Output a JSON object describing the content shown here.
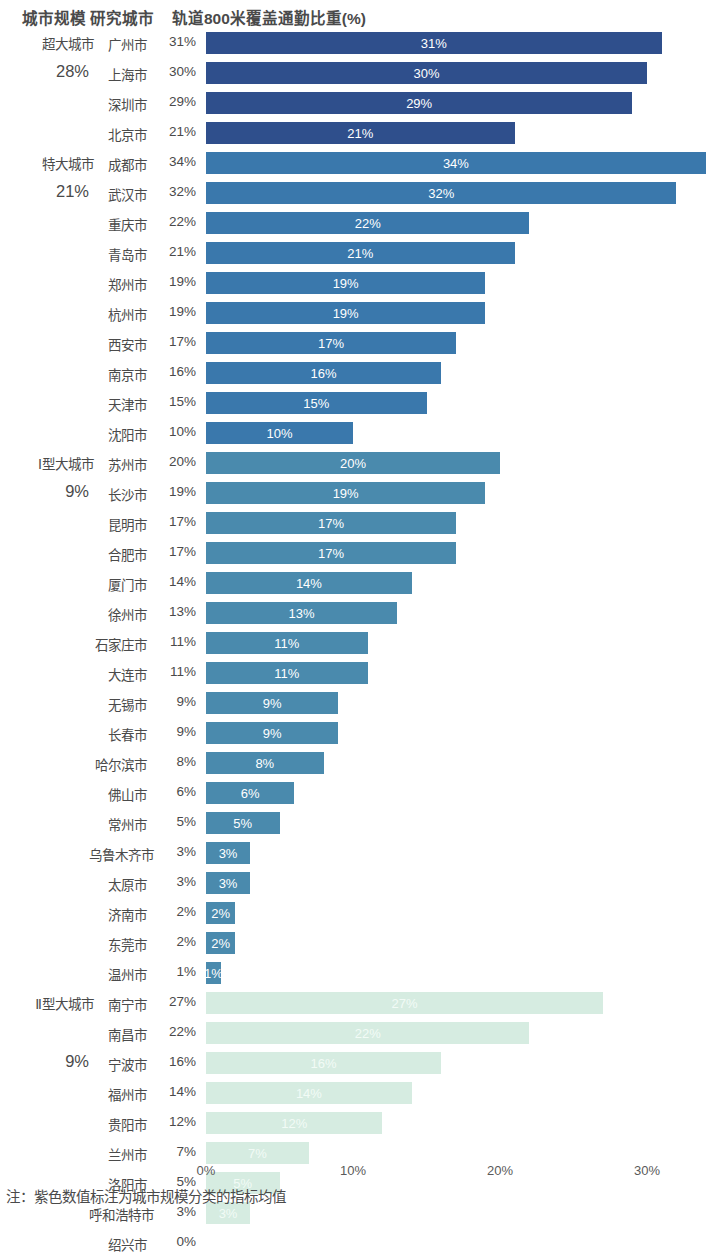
{
  "header": {
    "col_size": "城市规模",
    "col_city": "研究城市",
    "col_value": "轨道800米覆盖通勤比重(%)"
  },
  "axis": {
    "ticks": [
      "0%",
      "10%",
      "20%",
      "30%"
    ],
    "tick_values": [
      0,
      10,
      20,
      30
    ]
  },
  "footnote": "注：紫色数值标注为城市规模分类的指标均值",
  "colors": {
    "super_large": "#2f4f8c",
    "mega": "#3a78ac",
    "large_type1": "#4a8aad",
    "large_type2": "#d6ece1",
    "text": "#4a4a4a",
    "bar_label": "#ffffff"
  },
  "chart_data": {
    "type": "bar",
    "title": "轨道800米覆盖通勤比重(%)",
    "xlabel": "",
    "ylabel": "",
    "orientation": "horizontal",
    "xlim": [
      0,
      33
    ],
    "grid": false,
    "legend": "none",
    "categories": [
      "广州市",
      "上海市",
      "深圳市",
      "北京市",
      "成都市",
      "武汉市",
      "重庆市",
      "青岛市",
      "郑州市",
      "杭州市",
      "西安市",
      "南京市",
      "天津市",
      "沈阳市",
      "苏州市",
      "长沙市",
      "昆明市",
      "合肥市",
      "厦门市",
      "徐州市",
      "石家庄市",
      "大连市",
      "无锡市",
      "长春市",
      "哈尔滨市",
      "佛山市",
      "常州市",
      "乌鲁木齐市",
      "太原市",
      "济南市",
      "东莞市",
      "温州市",
      "南宁市",
      "南昌市",
      "宁波市",
      "福州市",
      "贵阳市",
      "兰州市",
      "洛阳市",
      "呼和浩特市",
      "绍兴市"
    ],
    "values": [
      31,
      30,
      29,
      21,
      34,
      32,
      22,
      21,
      19,
      19,
      17,
      16,
      15,
      10,
      20,
      19,
      17,
      17,
      14,
      13,
      11,
      11,
      9,
      9,
      8,
      6,
      5,
      3,
      3,
      2,
      2,
      1,
      27,
      22,
      16,
      14,
      12,
      7,
      5,
      3,
      0
    ],
    "groups": [
      {
        "name": "超大城市",
        "average": "28%",
        "color": "#2f4f8c",
        "rows": [
          {
            "city": "广州市",
            "value": 31,
            "label": "31%"
          },
          {
            "city": "上海市",
            "value": 30,
            "label": "30%"
          },
          {
            "city": "深圳市",
            "value": 29,
            "label": "29%"
          },
          {
            "city": "北京市",
            "value": 21,
            "label": "21%"
          }
        ]
      },
      {
        "name": "特大城市",
        "average": "21%",
        "color": "#3a78ac",
        "rows": [
          {
            "city": "成都市",
            "value": 34,
            "label": "34%"
          },
          {
            "city": "武汉市",
            "value": 32,
            "label": "32%"
          },
          {
            "city": "重庆市",
            "value": 22,
            "label": "22%"
          },
          {
            "city": "青岛市",
            "value": 21,
            "label": "21%"
          },
          {
            "city": "郑州市",
            "value": 19,
            "label": "19%"
          },
          {
            "city": "杭州市",
            "value": 19,
            "label": "19%"
          },
          {
            "city": "西安市",
            "value": 17,
            "label": "17%"
          },
          {
            "city": "南京市",
            "value": 16,
            "label": "16%"
          },
          {
            "city": "天津市",
            "value": 15,
            "label": "15%"
          },
          {
            "city": "沈阳市",
            "value": 10,
            "label": "10%"
          }
        ]
      },
      {
        "name": "Ⅰ型大城市",
        "average": "9%",
        "color": "#4a8aad",
        "rows": [
          {
            "city": "苏州市",
            "value": 20,
            "label": "20%"
          },
          {
            "city": "长沙市",
            "value": 19,
            "label": "19%"
          },
          {
            "city": "昆明市",
            "value": 17,
            "label": "17%"
          },
          {
            "city": "合肥市",
            "value": 17,
            "label": "17%"
          },
          {
            "city": "厦门市",
            "value": 14,
            "label": "14%"
          },
          {
            "city": "徐州市",
            "value": 13,
            "label": "13%"
          },
          {
            "city": "石家庄市",
            "value": 11,
            "label": "11%"
          },
          {
            "city": "大连市",
            "value": 11,
            "label": "11%"
          },
          {
            "city": "无锡市",
            "value": 9,
            "label": "9%"
          },
          {
            "city": "长春市",
            "value": 9,
            "label": "9%"
          },
          {
            "city": "哈尔滨市",
            "value": 8,
            "label": "8%"
          },
          {
            "city": "佛山市",
            "value": 6,
            "label": "6%"
          },
          {
            "city": "常州市",
            "value": 5,
            "label": "5%"
          },
          {
            "city": "乌鲁木齐市",
            "value": 3,
            "label": "3%"
          },
          {
            "city": "太原市",
            "value": 3,
            "label": "3%"
          },
          {
            "city": "济南市",
            "value": 2,
            "label": "2%"
          },
          {
            "city": "东莞市",
            "value": 2,
            "label": "2%"
          },
          {
            "city": "温州市",
            "value": 1,
            "label": "1%"
          }
        ]
      },
      {
        "name": "Ⅱ型大城市",
        "average": "9%",
        "color": "#d6ece1",
        "rows": [
          {
            "city": "南宁市",
            "value": 27,
            "label": "27%"
          },
          {
            "city": "南昌市",
            "value": 22,
            "label": "22%"
          },
          {
            "city": "宁波市",
            "value": 16,
            "label": "16%"
          },
          {
            "city": "福州市",
            "value": 14,
            "label": "14%"
          },
          {
            "city": "贵阳市",
            "value": 12,
            "label": "12%"
          },
          {
            "city": "兰州市",
            "value": 7,
            "label": "7%"
          },
          {
            "city": "洛阳市",
            "value": 5,
            "label": "5%"
          },
          {
            "city": "呼和浩特市",
            "value": 3,
            "label": "3%"
          },
          {
            "city": "绍兴市",
            "value": 0,
            "label": ""
          }
        ]
      }
    ]
  }
}
